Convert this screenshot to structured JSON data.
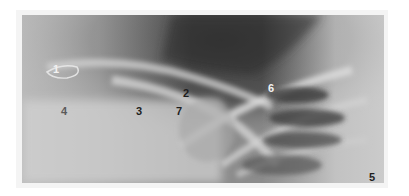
{
  "figure": {
    "type": "radiograph",
    "background_color": "#ffffff",
    "labels": [
      {
        "id": "1",
        "text": "1",
        "x": 53,
        "y": 64,
        "tone": "light"
      },
      {
        "id": "2",
        "text": "2",
        "x": 183,
        "y": 88,
        "tone": "dark"
      },
      {
        "id": "3",
        "text": "3",
        "x": 136,
        "y": 106,
        "tone": "dark"
      },
      {
        "id": "4",
        "text": "4",
        "x": 61,
        "y": 106,
        "tone": "mid"
      },
      {
        "id": "5",
        "text": "5",
        "x": 369,
        "y": 172,
        "tone": "dark"
      },
      {
        "id": "6",
        "text": "6",
        "x": 268,
        "y": 83,
        "tone": "light"
      },
      {
        "id": "7",
        "text": "7",
        "x": 176,
        "y": 106,
        "tone": "dark"
      }
    ]
  }
}
